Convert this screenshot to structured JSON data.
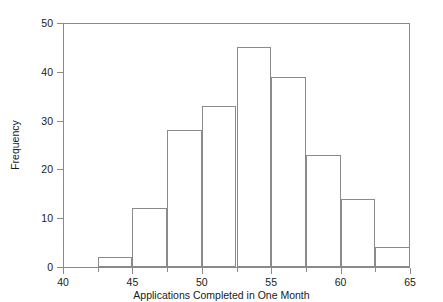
{
  "chart_data": {
    "type": "bar",
    "title": "",
    "subtitle": "",
    "xlabel": "Applications Completed in One Month",
    "ylabel": "Frequency",
    "xlim": [
      40,
      65
    ],
    "ylim": [
      0,
      50
    ],
    "bin_width": 2.5,
    "grid": false,
    "legend": null,
    "x_ticks": [
      40,
      45,
      50,
      55,
      60,
      65
    ],
    "x_tick_labels": [
      "40",
      "45",
      "50",
      "55",
      "60",
      "65"
    ],
    "x_minor_ticks": [
      42.5,
      47.5,
      52.5,
      57.5,
      62.5
    ],
    "y_ticks": [
      0,
      10,
      20,
      30,
      40,
      50
    ],
    "y_tick_labels": [
      "0",
      "10",
      "20",
      "30",
      "40",
      "50"
    ],
    "bins": [
      {
        "start": 42.5,
        "end": 45.0,
        "value": 2
      },
      {
        "start": 45.0,
        "end": 47.5,
        "value": 12
      },
      {
        "start": 47.5,
        "end": 50.0,
        "value": 28
      },
      {
        "start": 50.0,
        "end": 52.5,
        "value": 33
      },
      {
        "start": 52.5,
        "end": 55.0,
        "value": 45
      },
      {
        "start": 55.0,
        "end": 57.5,
        "value": 39
      },
      {
        "start": 57.5,
        "end": 60.0,
        "value": 23
      },
      {
        "start": 60.0,
        "end": 62.5,
        "value": 14
      },
      {
        "start": 62.5,
        "end": 65.0,
        "value": 4
      }
    ],
    "categories": [
      "42.5-45",
      "45-47.5",
      "47.5-50",
      "50-52.5",
      "52.5-55",
      "55-57.5",
      "57.5-60",
      "60-62.5",
      "62.5-65"
    ],
    "values": [
      2,
      12,
      28,
      33,
      45,
      39,
      23,
      14,
      4
    ],
    "colors": {
      "background": "#ffffff",
      "bar_fill": "transparent",
      "bar_stroke": "#8a8a8a",
      "axis": "#8a8a8a",
      "text": "#1a1a1a"
    }
  }
}
